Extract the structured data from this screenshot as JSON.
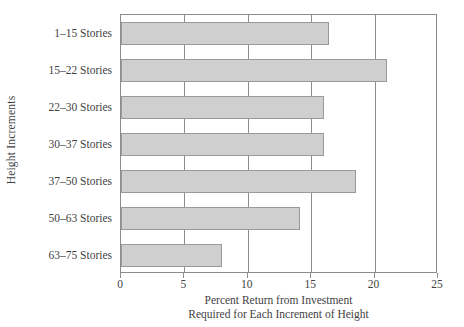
{
  "chart_data": {
    "type": "bar",
    "orientation": "horizontal",
    "title": "",
    "xlabel": "Percent Return from Investment Required for Each Increment of Height",
    "xlabel_line1": "Percent Return from Investment",
    "xlabel_line2": "Required for Each Increment of Height",
    "ylabel": "Height Increments",
    "categories": [
      "1–15 Stories",
      "15–22 Stories",
      "22–30 Stories",
      "30–37 Stories",
      "37–50 Stories",
      "50–63 Stories",
      "63–75 Stories"
    ],
    "values": [
      16.4,
      21.0,
      16.0,
      16.0,
      18.5,
      14.1,
      8.0
    ],
    "xticks": [
      0,
      5,
      10,
      15,
      20,
      25
    ],
    "xticklabels": [
      "0",
      "5",
      "10",
      "15",
      "20",
      "25"
    ],
    "xlim": [
      0,
      25
    ],
    "grid": "vertical",
    "legend": "none",
    "bar_fill_color": "#cfcfcf",
    "bar_edge_color": "#9a9a9a",
    "axis_color": "#8c8c8c",
    "text_color": "#3f3f3f"
  }
}
